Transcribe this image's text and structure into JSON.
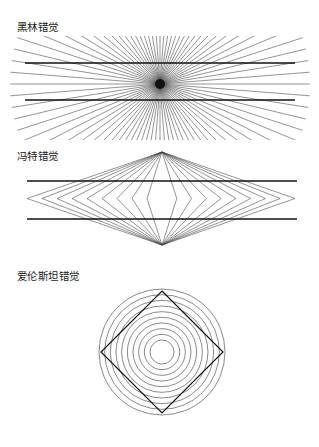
{
  "page": {
    "background_color": "#ffffff",
    "width": 319,
    "height": 447,
    "stroke_color": "#222222",
    "thin_stroke_color": "#3a3a3a",
    "text_color": "#1a1a1a"
  },
  "figures": [
    {
      "id": "hering",
      "label": "黑林错觉",
      "label_en_meaning": "Hering illusion",
      "type": "radial-fan-with-parallel-lines",
      "center": {
        "x": 160,
        "y": 84
      },
      "ray_count": 40,
      "ray_length": 150,
      "center_dot_radius": 5,
      "parallel_lines": [
        {
          "y": 63,
          "x1": 25,
          "x2": 295
        },
        {
          "y": 100,
          "x1": 25,
          "x2": 295
        }
      ]
    },
    {
      "id": "wundt",
      "label": "冯特错觉",
      "label_en_meaning": "Wundt illusion",
      "type": "nested-diamonds-with-parallel-lines",
      "top_apex": {
        "x": 162,
        "y": 152
      },
      "bottom_apex": {
        "x": 162,
        "y": 245
      },
      "left_vertex_x": 27,
      "right_vertex_x": 295,
      "nested_count": 9,
      "parallel_lines": [
        {
          "y": 181,
          "x1": 27,
          "x2": 297
        },
        {
          "y": 219,
          "x1": 27,
          "x2": 297
        }
      ]
    },
    {
      "id": "ehrenstein",
      "label": "爱伦斯坦错觉",
      "label_en_meaning": "Ehrenstein illusion",
      "type": "concentric-circles-with-inscribed-square",
      "center": {
        "x": 162,
        "y": 352
      },
      "outer_radius": 63,
      "inner_radius": 12,
      "circle_count": 10,
      "square_rotation_deg": 45,
      "square_half_diagonal": 61
    }
  ]
}
